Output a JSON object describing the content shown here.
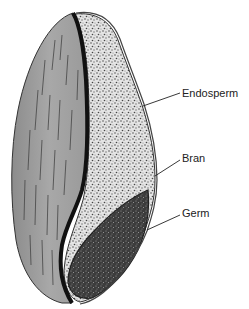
{
  "diagram": {
    "labels": [
      {
        "id": "endosperm",
        "text": "Endosperm"
      },
      {
        "id": "bran",
        "text": "Bran"
      },
      {
        "id": "germ",
        "text": "Germ"
      }
    ],
    "colors": {
      "outer_shell": "#9a9a9a",
      "outer_shell_light": "#b8b8b8",
      "divider": "#111111",
      "endosperm_bg": "#e6e6e6",
      "endosperm_speckle": "#555555",
      "germ_bg": "#3a3a3a",
      "germ_speckle": "#9a9a9a",
      "leader_line": "#222222",
      "text": "#222222"
    }
  }
}
